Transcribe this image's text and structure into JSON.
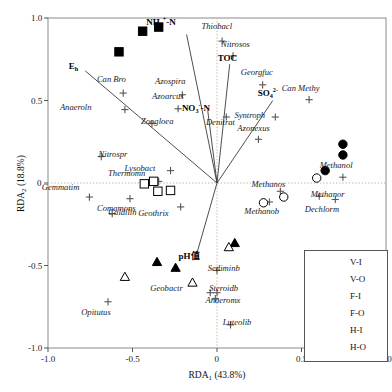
{
  "chart_data": {
    "type": "scatter",
    "title": "",
    "xlabel": "RDA1 (43.8%)",
    "ylabel": "RDA2 (18.8%)",
    "xlim": [
      -1.0,
      1.0
    ],
    "ylim": [
      -1.0,
      1.0
    ],
    "xticks": [
      "-1.0",
      "-0.5",
      "0",
      "0.5",
      "1.0"
    ],
    "yticks": [
      "1.0",
      "0.5",
      "0",
      "-0.5",
      "-1.0"
    ],
    "grid": "zero-lines-dotted",
    "legend_position": "bottom-right",
    "legend": [
      {
        "label": "V-I",
        "marker": "filled-square"
      },
      {
        "label": "V-O",
        "marker": "open-square"
      },
      {
        "label": "F-I",
        "marker": "filled-circle"
      },
      {
        "label": "F-O",
        "marker": "open-circle"
      },
      {
        "label": "H-I",
        "marker": "filled-triangle"
      },
      {
        "label": "H-O",
        "marker": "open-triangle"
      }
    ],
    "env_vectors": [
      {
        "name": "Eh",
        "html": "E<sub>h</sub>",
        "x": -0.78,
        "y": 0.68,
        "lx": -0.85,
        "ly": 0.695
      },
      {
        "name": "NH4-N",
        "html": "NH<sub>4</sub><sup>+</sup>-N",
        "x": -0.18,
        "y": 0.9,
        "lx": -0.33,
        "ly": 0.975
      },
      {
        "name": "TOC",
        "html": "TOC",
        "x": 0.075,
        "y": 0.72,
        "lx": 0.06,
        "ly": 0.745
      },
      {
        "name": "NO3-N",
        "html": "NO<sub>3</sub><sup>-</sup>-N",
        "x": -0.055,
        "y": 0.44,
        "lx": -0.125,
        "ly": 0.455
      },
      {
        "name": "SO4",
        "html": "SO<sub>4</sub><sup>2-</sup>",
        "x": 0.33,
        "y": 0.5,
        "lx": 0.3,
        "ly": 0.545
      },
      {
        "name": "pH",
        "html": "pH值",
        "x": -0.12,
        "y": -0.43,
        "lx": -0.165,
        "ly": -0.455
      }
    ],
    "species": [
      {
        "label": "Can Bro",
        "x": -0.555,
        "y": 0.545,
        "lx": -0.625,
        "ly": 0.625
      },
      {
        "label": "Azospira",
        "x": -0.205,
        "y": 0.535,
        "lx": -0.275,
        "ly": 0.615
      },
      {
        "label": "Anaeroln",
        "x": -0.545,
        "y": 0.445,
        "lx": -0.835,
        "ly": 0.455
      },
      {
        "label": "Azoarcus",
        "x": -0.23,
        "y": 0.45,
        "lx": -0.29,
        "ly": 0.52
      },
      {
        "label": "Zoogloea",
        "x": -0.385,
        "y": 0.36,
        "lx": -0.355,
        "ly": 0.37
      },
      {
        "label": "Thiobacl",
        "x": 0.03,
        "y": 0.86,
        "lx": 0.0,
        "ly": 0.945
      },
      {
        "label": "Nitrosos",
        "x": 0.095,
        "y": 0.77,
        "lx": 0.11,
        "ly": 0.835
      },
      {
        "label": "Georgfuc",
        "x": 0.27,
        "y": 0.595,
        "lx": 0.235,
        "ly": 0.665
      },
      {
        "label": "Can Methy",
        "x": 0.545,
        "y": 0.505,
        "lx": 0.495,
        "ly": 0.57
      },
      {
        "label": "Denitrat",
        "x": 0.055,
        "y": 0.4,
        "lx": 0.02,
        "ly": 0.365
      },
      {
        "label": "Syntroph",
        "x": 0.345,
        "y": 0.4,
        "lx": 0.195,
        "ly": 0.408
      },
      {
        "label": "Azonexus",
        "x": 0.245,
        "y": 0.265,
        "lx": 0.215,
        "ly": 0.33
      },
      {
        "label": "Nitrospr",
        "x": -0.685,
        "y": 0.16,
        "lx": -0.615,
        "ly": 0.17
      },
      {
        "label": "Lysobact",
        "x": -0.275,
        "y": 0.075,
        "lx": -0.455,
        "ly": 0.085
      },
      {
        "label": "Thermomn",
        "x": -0.345,
        "y": 0.01,
        "lx": -0.535,
        "ly": 0.055
      },
      {
        "label": "Gemmatim",
        "x": -0.755,
        "y": -0.085,
        "lx": -0.925,
        "ly": -0.03
      },
      {
        "label": "Comamons",
        "x": -0.515,
        "y": -0.095,
        "lx": -0.595,
        "ly": -0.16
      },
      {
        "label": "Caldilin",
        "x": -0.62,
        "y": -0.185,
        "lx": -0.56,
        "ly": -0.18
      },
      {
        "label": "Geothrix",
        "x": -0.215,
        "y": -0.145,
        "lx": -0.375,
        "ly": -0.185
      },
      {
        "label": "Methanol",
        "x": 0.745,
        "y": 0.035,
        "lx": 0.705,
        "ly": 0.105
      },
      {
        "label": "Methanor",
        "x": 0.605,
        "y": -0.08,
        "lx": 0.655,
        "ly": -0.07
      },
      {
        "label": "Methanos",
        "x": 0.375,
        "y": -0.05,
        "lx": 0.305,
        "ly": -0.015
      },
      {
        "label": "Methanob",
        "x": 0.31,
        "y": -0.115,
        "lx": 0.265,
        "ly": -0.175
      },
      {
        "label": "Dechlorm",
        "x": 0.7,
        "y": -0.1,
        "lx": 0.62,
        "ly": -0.165
      },
      {
        "label": "Sediminb",
        "x": 0.0,
        "y": -0.53,
        "lx": 0.04,
        "ly": -0.52
      },
      {
        "label": "Steroidb",
        "x": 0.0,
        "y": -0.665,
        "lx": 0.04,
        "ly": -0.645
      },
      {
        "label": "Anaeromx",
        "x": -0.01,
        "y": -0.7,
        "lx": 0.035,
        "ly": -0.715
      },
      {
        "label": "Geobactr",
        "x": -0.04,
        "y": -0.665,
        "lx": -0.3,
        "ly": -0.64
      },
      {
        "label": "Opitutus",
        "x": -0.645,
        "y": -0.72,
        "lx": -0.715,
        "ly": -0.785
      },
      {
        "label": "Luteolib",
        "x": 0.08,
        "y": -0.86,
        "lx": 0.12,
        "ly": -0.85
      }
    ],
    "samples": [
      {
        "group": "V-I",
        "x": -0.44,
        "y": 0.92
      },
      {
        "group": "V-I",
        "x": -0.345,
        "y": 0.945
      },
      {
        "group": "V-I",
        "x": -0.58,
        "y": 0.795
      },
      {
        "group": "V-O",
        "x": -0.43,
        "y": -0.005
      },
      {
        "group": "V-O",
        "x": -0.375,
        "y": 0.01
      },
      {
        "group": "V-O",
        "x": -0.35,
        "y": -0.05
      },
      {
        "group": "V-O",
        "x": -0.275,
        "y": -0.045
      },
      {
        "group": "F-I",
        "x": 0.745,
        "y": 0.235
      },
      {
        "group": "F-I",
        "x": 0.745,
        "y": 0.17
      },
      {
        "group": "F-I",
        "x": 0.64,
        "y": 0.075
      },
      {
        "group": "F-O",
        "x": 0.59,
        "y": 0.03
      },
      {
        "group": "F-O",
        "x": 0.395,
        "y": -0.085
      },
      {
        "group": "F-O",
        "x": 0.275,
        "y": -0.12
      },
      {
        "group": "H-I",
        "x": -0.355,
        "y": -0.48
      },
      {
        "group": "H-I",
        "x": -0.245,
        "y": -0.515
      },
      {
        "group": "H-I",
        "x": 0.105,
        "y": -0.365
      },
      {
        "group": "H-O",
        "x": 0.07,
        "y": -0.39
      },
      {
        "group": "H-O",
        "x": -0.145,
        "y": -0.605
      },
      {
        "group": "H-O",
        "x": -0.545,
        "y": -0.57
      }
    ]
  }
}
